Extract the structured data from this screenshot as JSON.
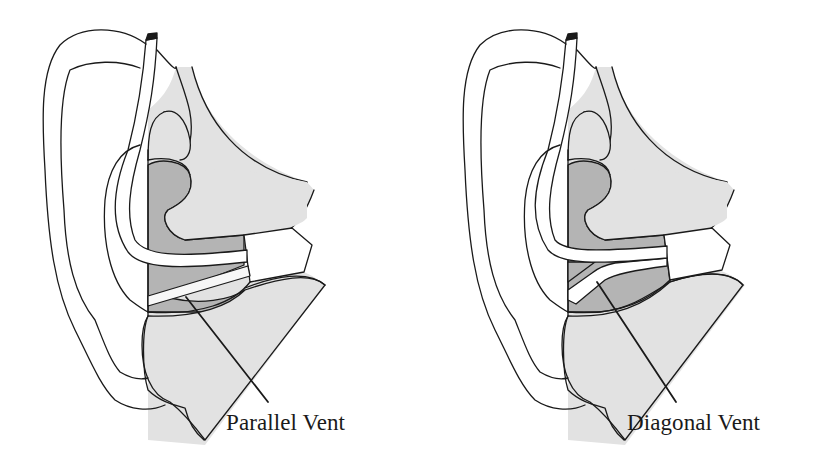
{
  "figures": [
    {
      "id": "parallel",
      "caption": "Parallel Vent",
      "description": "Ear cross-section with earmold; vent runs parallel to the sound bore"
    },
    {
      "id": "diagonal",
      "caption": "Diagonal Vent",
      "description": "Ear cross-section with earmold; vent branches diagonally into the sound bore"
    }
  ],
  "colors": {
    "line": "#1a1a1a",
    "tissue_light": "#e2e2e2",
    "earmold_dark": "#b4b4b4",
    "tube_fill": "#ffffff",
    "background": "#ffffff"
  }
}
